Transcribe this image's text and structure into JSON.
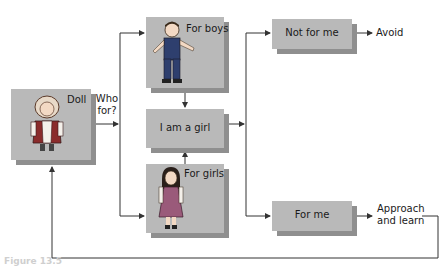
{
  "diagram": {
    "nodes": {
      "doll": {
        "label": "Doll",
        "icon": "doll-figure"
      },
      "boys": {
        "label": "For boys",
        "icon": "boy-figure"
      },
      "girl": {
        "label": "I am a girl"
      },
      "girls": {
        "label": "For girls",
        "icon": "girl-figure"
      },
      "not_for_me": {
        "label": "Not for me"
      },
      "for_me": {
        "label": "For me"
      }
    },
    "annotations": {
      "who_for_line1": "Who",
      "who_for_line2": "for?",
      "avoid": "Avoid",
      "approach_line1": "Approach",
      "approach_line2": "and learn"
    },
    "caption": "Figure 13.5",
    "colors": {
      "box": "#b9b9b9",
      "shadow": "#8f8f8f",
      "line": "#333333"
    },
    "edges": [
      {
        "from": "doll",
        "to": "boys|girls",
        "label": "Who for?"
      },
      {
        "from": "boys",
        "to": "girl"
      },
      {
        "from": "girls",
        "to": "girl"
      },
      {
        "from": "girl",
        "to": "not_for_me"
      },
      {
        "from": "girl",
        "to": "for_me"
      },
      {
        "from": "not_for_me",
        "to": "avoid"
      },
      {
        "from": "for_me",
        "to": "approach_and_learn"
      },
      {
        "from": "approach_and_learn",
        "to": "doll"
      }
    ]
  }
}
